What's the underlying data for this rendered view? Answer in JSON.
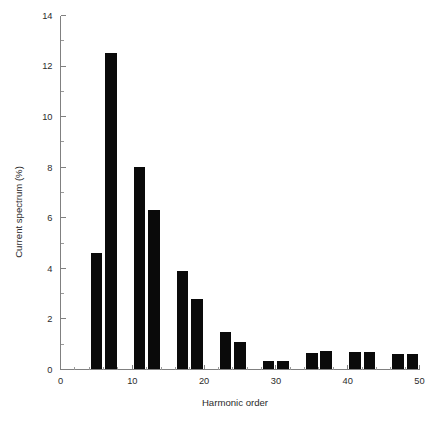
{
  "chart_data": {
    "type": "bar",
    "title": "",
    "xlabel": "Harmonic order",
    "ylabel": "Current spectrum (%)",
    "xlim": [
      0,
      50
    ],
    "ylim": [
      0,
      14
    ],
    "grid": false,
    "legend_position": "none",
    "x_ticks_major": [
      0,
      10,
      20,
      30,
      40,
      50
    ],
    "x_tick_labels": [
      "0",
      "10",
      "20",
      "30",
      "40",
      "50"
    ],
    "x_ticks_minor": [
      5,
      15,
      25,
      35,
      45
    ],
    "y_ticks_major": [
      0,
      2,
      4,
      6,
      8,
      10,
      12,
      14
    ],
    "y_tick_labels": [
      "0",
      "2",
      "4",
      "6",
      "8",
      "10",
      "12",
      "14"
    ],
    "y_ticks_minor": [
      1,
      3,
      5,
      7,
      9,
      11,
      13
    ],
    "bar_color": "#0a0a0a",
    "bar_width": 1.6,
    "categories": [
      5,
      7,
      11,
      13,
      17,
      19,
      23,
      25,
      29,
      31,
      35,
      37,
      41,
      43,
      47,
      49
    ],
    "values": [
      4.6,
      12.5,
      8.0,
      6.3,
      3.9,
      2.8,
      1.5,
      1.1,
      0.35,
      0.35,
      0.65,
      0.75,
      0.7,
      0.7,
      0.6,
      0.6
    ],
    "series": [
      {
        "name": "Current spectrum (%)",
        "points": [
          {
            "order": 5,
            "value": 4.6
          },
          {
            "order": 7,
            "value": 12.5
          },
          {
            "order": 11,
            "value": 8.0
          },
          {
            "order": 13,
            "value": 6.3
          },
          {
            "order": 17,
            "value": 3.9
          },
          {
            "order": 19,
            "value": 2.8
          },
          {
            "order": 23,
            "value": 1.5
          },
          {
            "order": 25,
            "value": 1.1
          },
          {
            "order": 29,
            "value": 0.35
          },
          {
            "order": 31,
            "value": 0.35
          },
          {
            "order": 35,
            "value": 0.65
          },
          {
            "order": 37,
            "value": 0.75
          },
          {
            "order": 41,
            "value": 0.7
          },
          {
            "order": 43,
            "value": 0.7
          },
          {
            "order": 47,
            "value": 0.6
          },
          {
            "order": 49,
            "value": 0.6
          }
        ]
      }
    ]
  }
}
